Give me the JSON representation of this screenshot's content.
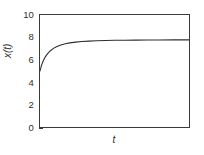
{
  "chart_data": {
    "type": "line",
    "title": "",
    "subtitle": "",
    "xlabel": "t",
    "ylabel": "x(t)",
    "xlim": [
      0,
      10
    ],
    "ylim": [
      0,
      10
    ],
    "grid": false,
    "legend": null,
    "x_ticks": [],
    "x_tick_labels": [],
    "y_ticks": [
      0,
      2,
      4,
      6,
      8,
      10
    ],
    "y_tick_labels": [
      "0",
      "2",
      "4",
      "6",
      "8",
      "10"
    ],
    "series": [
      {
        "name": "x(t)",
        "color": "#2e2e2e",
        "x": [
          0.0,
          0.1,
          0.2,
          0.3,
          0.4,
          0.5,
          0.7,
          0.9,
          1.1,
          1.4,
          1.7,
          2.0,
          2.4,
          2.8,
          3.3,
          3.8,
          4.4,
          5.0,
          5.7,
          6.4,
          7.2,
          8.0,
          9.0,
          10.0
        ],
        "values": [
          5.0,
          5.5,
          5.85,
          6.13,
          6.35,
          6.53,
          6.81,
          7.02,
          7.17,
          7.33,
          7.44,
          7.51,
          7.58,
          7.63,
          7.67,
          7.7,
          7.72,
          7.74,
          7.75,
          7.76,
          7.77,
          7.77,
          7.78,
          7.78
        ],
        "asymptote": 7.8,
        "initial_value": 5.0
      }
    ]
  },
  "axis": {
    "y_tick_labels": [
      "10",
      "8",
      "6",
      "4",
      "2",
      "0"
    ],
    "y_label": "x(t)",
    "x_label": "t"
  },
  "colors": {
    "curve": "#2e2e2e",
    "frame": "#3a3a3a",
    "text": "#2e2e2e",
    "background": "#ffffff"
  }
}
